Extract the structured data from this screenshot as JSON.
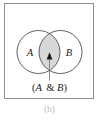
{
  "figure": {
    "type": "venn-diagram",
    "subfigure_label": "(b)",
    "frame": {
      "border_color": "#8e8e8e",
      "background_color": "#ffffff"
    },
    "sets": [
      {
        "id": "A",
        "label": "A",
        "position": "left",
        "fill_color": "#ffffff",
        "stroke_color": "#4d4d4d"
      },
      {
        "id": "B",
        "label": "B",
        "position": "right",
        "fill_color": "#ffffff",
        "stroke_color": "#4d4d4d"
      }
    ],
    "intersection": {
      "label": "(A & B)",
      "label_open_paren": "(",
      "label_left_set": "A",
      "label_operator": "&",
      "label_right_set": "B",
      "label_close_paren": ")",
      "fill_color": "#d8d8d8",
      "highlighted": true
    },
    "annotation": {
      "arrow_color": "#1a1a1a",
      "arrow_direction": "up",
      "leader_line_color": "#7a7a7a",
      "points_to": "intersection"
    }
  }
}
